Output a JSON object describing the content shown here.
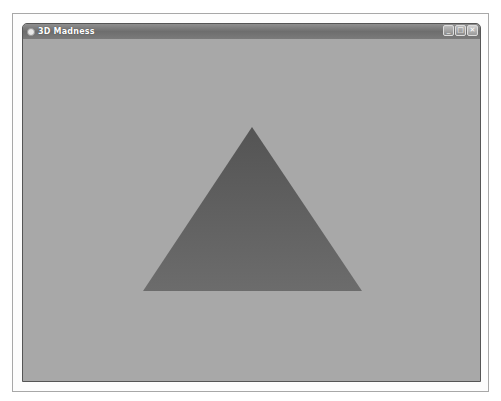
{
  "window": {
    "title": "3D Madness",
    "controls": {
      "minimize": "_",
      "maximize": "□",
      "close": "✕"
    }
  },
  "scene": {
    "background_color": "#a8a8a8",
    "shape": "triangle",
    "triangle": {
      "apex": [
        252,
        127
      ],
      "base_left": [
        143,
        291
      ],
      "base_right": [
        362,
        291
      ],
      "top_color": "#545454",
      "bottom_color": "#6c6c6c"
    }
  }
}
